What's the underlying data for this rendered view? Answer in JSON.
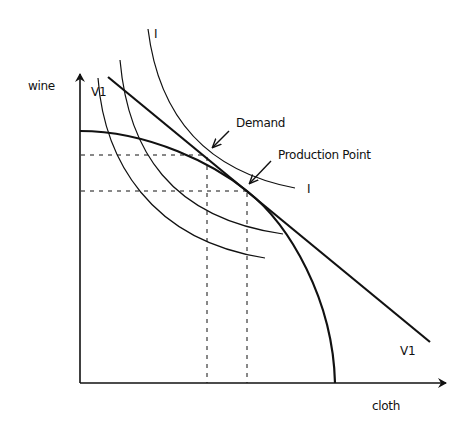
{
  "diagram": {
    "type": "production-possibility-frontier",
    "axes": {
      "y_label": "wine",
      "x_label": "cloth"
    },
    "curves": {
      "ppf": {
        "name": "production possibility frontier"
      },
      "price_line": {
        "label_top": "V1",
        "label_bottom": "V1"
      },
      "indifference": [
        {
          "label_top": "I",
          "label_right": "I",
          "role": "highest, tangent at demand"
        },
        {
          "label": "",
          "role": "middle"
        },
        {
          "label": "",
          "role": "lowest"
        }
      ]
    },
    "annotations": {
      "demand": "Demand",
      "production_point": "Production Point"
    },
    "colors": {
      "ink": "#111111",
      "background": "#ffffff"
    }
  }
}
